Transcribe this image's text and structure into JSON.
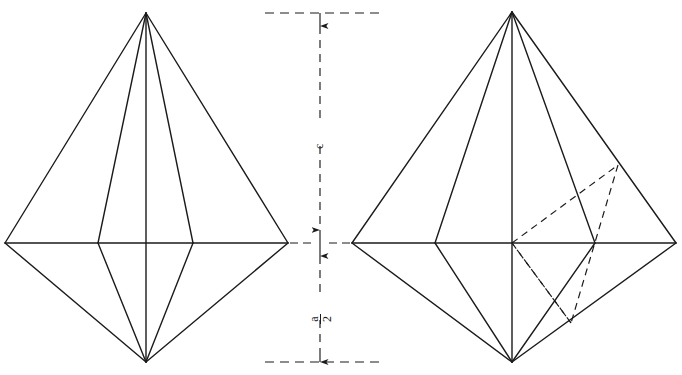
{
  "figure": {
    "background_color": "#ffffff",
    "line_color": "#1b1b1b",
    "solid_stroke_width": 1.4,
    "dashed_stroke_width": 1.2,
    "dash_pattern": "7,5"
  },
  "dimension_line": {
    "name": "vertical-center-dimension",
    "axis_x": 320,
    "top_y": 13,
    "mid_y": 243,
    "bottom_y": 362,
    "extension_top": {
      "x1": 265,
      "x2": 385,
      "y": 13
    },
    "extension_mid": {
      "x1": 290,
      "x2": 352,
      "y": 243
    },
    "extension_bottom": {
      "x1": 265,
      "x2": 385,
      "y": 362
    },
    "upper_label": {
      "numerator": "c",
      "denominator": "",
      "text": "c",
      "x": 311,
      "y": 131
    },
    "lower_label": {
      "numerator": "a",
      "denominator": "2",
      "text": "a/2",
      "x": 311,
      "y": 305
    },
    "arrow_count": 4
  },
  "left_figure": {
    "name": "left-bipyramid",
    "apex_top": {
      "x": 146,
      "y": 13
    },
    "apex_bottom": {
      "x": 146,
      "y": 362
    },
    "equator_y": 243,
    "equator_left_x": 5,
    "equator_right_x": 288,
    "inner_left_x": 98,
    "inner_right_x": 193,
    "has_hidden_lines": false
  },
  "right_figure": {
    "name": "right-bipyramid",
    "apex_top": {
      "x": 512,
      "y": 12
    },
    "apex_bottom": {
      "x": 512,
      "y": 362
    },
    "equator_y": 243,
    "equator_left_x": 352,
    "equator_right_x": 676,
    "inner_left_x": 435,
    "inner_right_x": 595,
    "has_hidden_lines": true,
    "hidden_quad": {
      "name": "dashed-section-plane",
      "center": {
        "x": 512,
        "y": 243
      },
      "upper_right": {
        "x": 618,
        "y": 165
      },
      "lower": {
        "x": 571,
        "y": 323
      }
    }
  }
}
